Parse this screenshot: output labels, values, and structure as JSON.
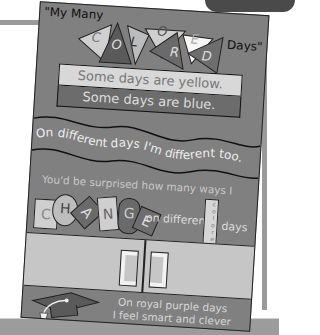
{
  "poster": {
    "title_prefix": "\"My Many",
    "title_suffix": "Days\"",
    "flag_letters": [
      "C",
      "O",
      "L",
      "O",
      "R",
      "E",
      "D"
    ],
    "band_yellow": "Some days are yellow.",
    "band_blue": "Some days are blue.",
    "wave_line": "On different days I'm different too.",
    "surprise_line": "You'd be surprised how many ways I",
    "change_letters": [
      "C",
      "H",
      "A",
      "N",
      "G",
      "E"
    ],
    "on_different": "on different",
    "colored_vertical": "colored",
    "days_word": "days",
    "purple_line_1": "On royal purple days",
    "purple_line_2": "I feel smart and clever"
  },
  "colors": {
    "poster_bg": "#808080",
    "yellow_band": "#d8d8d8",
    "blue_band": "#6c6c6c",
    "gray_panel": "#c6c6c6",
    "frame": "#9a9a9a"
  }
}
